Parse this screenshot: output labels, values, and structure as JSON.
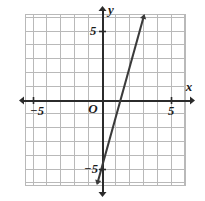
{
  "figure": {
    "kind": "coordinate-plane-graph",
    "width": 205,
    "height": 201,
    "background_color": "#ffffff"
  },
  "axes": {
    "x_axis_label": "x",
    "y_axis_label": "y",
    "origin_label": "O",
    "axis_color": "#2b2b2b",
    "grid_color": "#b9b9b9",
    "x_ticks": [
      {
        "value": -5,
        "label": "−5"
      },
      {
        "value": 5,
        "label": "5"
      }
    ],
    "y_ticks": [
      {
        "value": 5,
        "label": "5"
      },
      {
        "value": -5,
        "label": "−5"
      }
    ],
    "xlim": [
      -5.5,
      6.1
    ],
    "ylim": [
      -6.2,
      6.2
    ],
    "grid": true,
    "grid_step": 1,
    "arrowheads": [
      "left",
      "right",
      "up",
      "down"
    ]
  },
  "chart_data": {
    "type": "line",
    "title": "",
    "xlabel": "x",
    "ylabel": "y",
    "xlim": [
      -5.5,
      6.1
    ],
    "ylim": [
      -6.2,
      6.2
    ],
    "grid": true,
    "legend": "none",
    "series": [
      {
        "name": "line",
        "color": "#3a3a3a",
        "slope": 3.6,
        "y_intercept": -5,
        "x_intercept": 1.4,
        "equation": "y = 3.6x − 5",
        "arrow_both_ends": true,
        "points": [
          {
            "x": -0.2,
            "y": -5.7
          },
          {
            "x": 0,
            "y": -5
          },
          {
            "x": 1.4,
            "y": 0
          },
          {
            "x": 3.1,
            "y": 6.2
          }
        ]
      }
    ]
  }
}
